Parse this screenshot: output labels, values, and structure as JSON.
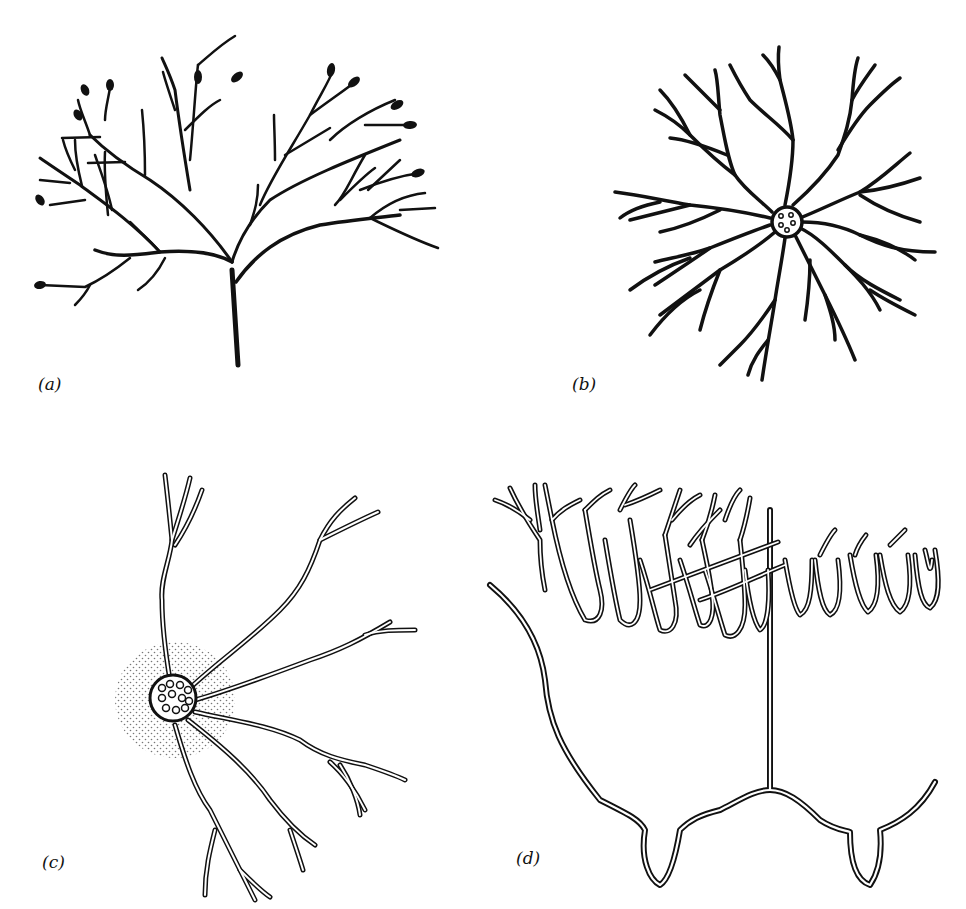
{
  "figure": {
    "panels": [
      {
        "id": "a",
        "label": "(a)",
        "description": "branching tree with dark oval tips"
      },
      {
        "id": "b",
        "label": "(b)",
        "description": "radial branching with central circle containing 5 small circles"
      },
      {
        "id": "c",
        "label": "(c)",
        "description": "cell body with many nuclei, stippled halo, double-line branching processes"
      },
      {
        "id": "d",
        "label": "(d)",
        "description": "double-line arch structure with dense branching canopy of U-shaped loops"
      }
    ],
    "colors": {
      "ink": "#111111",
      "background": "#ffffff",
      "stipple": "#777777"
    }
  }
}
